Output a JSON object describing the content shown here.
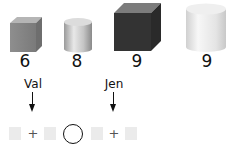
{
  "objects": [
    {
      "shape": "cube-small-gray",
      "value": "6"
    },
    {
      "shape": "cylinder-small-silver",
      "value": "8"
    },
    {
      "shape": "cube-large-dark",
      "value": "9"
    },
    {
      "shape": "cylinder-large-white",
      "value": "9"
    }
  ],
  "labels": {
    "left": "Val",
    "right": "Jen"
  },
  "equation": {
    "plus1": "+",
    "plus2": "+"
  }
}
